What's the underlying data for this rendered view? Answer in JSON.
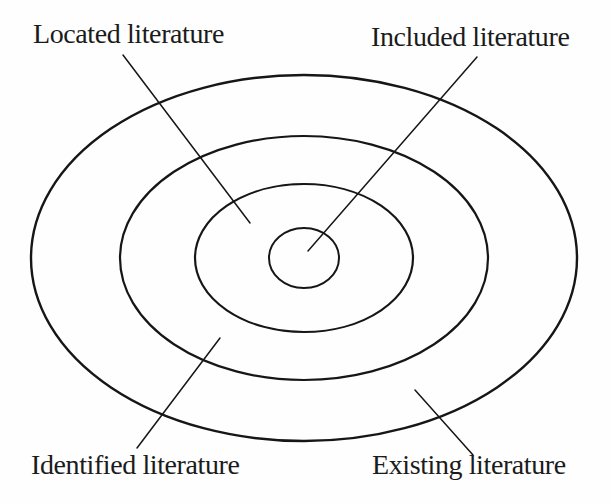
{
  "figure": {
    "background_color": "#fefefe",
    "stroke_color": "#161616",
    "text_color": "#1b1b1b"
  },
  "diagram": {
    "type": "concentric-ellipses",
    "center": {
      "x": 304,
      "y": 258
    },
    "rings": [
      {
        "id": "existing-ellipse",
        "label": "Existing literature",
        "rx": 273,
        "ry": 183,
        "stroke_width": 2.4
      },
      {
        "id": "identified-ellipse",
        "label": "Identified literature",
        "rx": 184,
        "ry": 122,
        "stroke_width": 2.2
      },
      {
        "id": "located-ellipse",
        "label": "Located literature",
        "rx": 109,
        "ry": 74,
        "stroke_width": 2.2
      },
      {
        "id": "included-ellipse",
        "label": "Included literature",
        "rx": 35,
        "ry": 30,
        "stroke_width": 2.0
      }
    ],
    "labels": [
      {
        "id": "located-label",
        "text": "Located literature",
        "x": 33,
        "y": 20
      },
      {
        "id": "included-label",
        "text": "Included literature",
        "x": 371,
        "y": 23
      },
      {
        "id": "identified-label",
        "text": "Identified literature",
        "x": 31,
        "y": 451
      },
      {
        "id": "existing-label",
        "text": "Existing literature",
        "x": 372,
        "y": 451
      }
    ],
    "leader_lines": [
      {
        "id": "located-leader",
        "x1": 123,
        "y1": 55,
        "x2": 250,
        "y2": 223,
        "stroke_width": 1.5
      },
      {
        "id": "included-leader",
        "x1": 477,
        "y1": 57,
        "x2": 308,
        "y2": 251,
        "stroke_width": 1.5
      },
      {
        "id": "identified-leader",
        "x1": 137,
        "y1": 448,
        "x2": 220,
        "y2": 338,
        "stroke_width": 1.5
      },
      {
        "id": "existing-leader",
        "x1": 473,
        "y1": 455,
        "x2": 415,
        "y2": 390,
        "stroke_width": 1.5
      }
    ]
  }
}
